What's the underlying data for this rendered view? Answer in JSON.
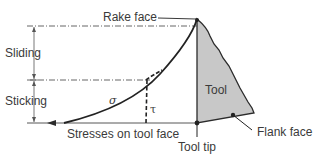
{
  "diagram": {
    "labels": {
      "rake_face": "Rake face",
      "sliding": "Sliding",
      "sticking": "Sticking",
      "sigma": "σ",
      "tau": "τ",
      "tool": "Tool",
      "stresses": "Stresses on tool face",
      "tool_tip": "Tool tip",
      "flank_face": "Flank face"
    },
    "colors": {
      "line": "#2b2b2b",
      "tool_fill": "#c8c8c8",
      "text": "#3a3a3a",
      "background": "#ffffff"
    }
  }
}
